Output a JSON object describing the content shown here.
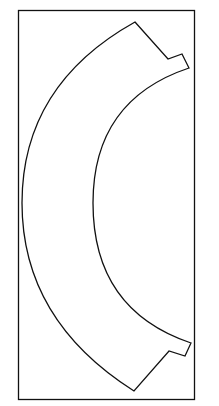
{
  "diagram": {
    "stroke_color": "#111111",
    "background": "#ffffff",
    "frame": {
      "x": 18,
      "y": 10,
      "width": 177,
      "height": 390
    },
    "shape": {
      "type": "arc-band-template",
      "outer_arc_leftmost_x": 22,
      "inner_arc_leftmost_x": 93,
      "center_y": 203,
      "tabs": 2
    }
  }
}
